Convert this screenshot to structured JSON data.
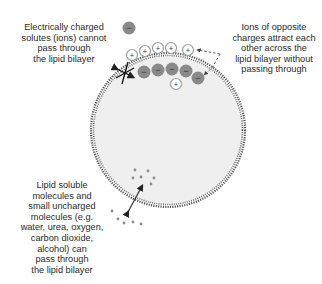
{
  "diagram": {
    "labels": {
      "ions_blocked": [
        "Electrically charged",
        "solutes (ions) cannot",
        "pass through",
        "the lipid bilayer"
      ],
      "ions_attract": [
        "Ions of opposite",
        "charges attract each",
        "other across the",
        "lipid bilayer without",
        "passing through"
      ],
      "small_molecules": [
        "Lipid soluble",
        "molecules and",
        "small uncharged",
        "molecules (e.g.",
        "water, urea, oxygen,",
        "carbon dioxide,",
        "alcohol) can",
        "pass through",
        "the lipid bilayer"
      ]
    },
    "symbols": {
      "positive": "+",
      "negative": "−"
    },
    "colors": {
      "cell_fill": "#efefef",
      "membrane": "#555555",
      "negative_ion": "#8a8a8a",
      "positive_ion_ring": "#9a9a9a",
      "molecule": "#8c8c8c",
      "text": "#2a2a2a"
    }
  }
}
